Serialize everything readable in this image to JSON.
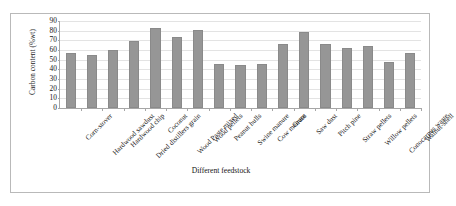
{
  "chart_data": {
    "type": "bar",
    "title": "",
    "xlabel": "Different feedstock",
    "ylabel": "Carbon content (%wt)",
    "ylim": [
      0,
      90
    ],
    "yticks": [
      0,
      10,
      20,
      30,
      40,
      50,
      60,
      70,
      80,
      90
    ],
    "grid": true,
    "legend": "none",
    "bar_color": "#969696",
    "categories": [
      "Corn-stover",
      "Hardwood sawdust",
      "Hardwood chip",
      "Dried distillers grain",
      "Coconut",
      "Wood Paste mixed",
      "Wood pellets",
      "Peanut hulls",
      "Swine manure",
      "Cow manure",
      "Grass",
      "Saw dust",
      "Pitch pine",
      "Straw pellets",
      "Willow pellets",
      "Conocarpus waste",
      "Walnut-shell"
    ],
    "values": [
      57,
      55,
      60,
      69,
      83,
      73,
      81,
      46,
      45,
      46,
      66,
      79,
      66,
      62,
      64,
      48,
      57
    ]
  }
}
